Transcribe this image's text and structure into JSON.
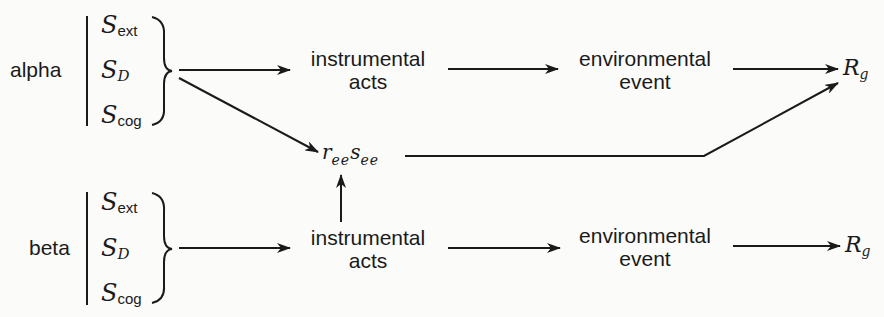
{
  "diagram": {
    "groups": [
      {
        "label": "alpha",
        "stimuli": [
          {
            "base": "S",
            "sub": "ext"
          },
          {
            "base": "S",
            "sub": "D"
          },
          {
            "base": "S",
            "sub": "cog"
          }
        ],
        "instrumental": {
          "line1": "instrumental",
          "line2": "acts"
        },
        "environmental": {
          "line1": "environmental",
          "line2": "event"
        },
        "response": {
          "base": "R",
          "sub": "g"
        }
      },
      {
        "label": "beta",
        "stimuli": [
          {
            "base": "S",
            "sub": "ext"
          },
          {
            "base": "S",
            "sub": "D"
          },
          {
            "base": "S",
            "sub": "cog"
          }
        ],
        "instrumental": {
          "line1": "instrumental",
          "line2": "acts"
        },
        "environmental": {
          "line1": "environmental",
          "line2": "event"
        },
        "response": {
          "base": "R",
          "sub": "g"
        }
      }
    ],
    "mediator": {
      "r": "r",
      "r_sub": "ee",
      "s": "s",
      "s_sub": "ee"
    },
    "colors": {
      "ink": "#1a1a1a",
      "background": "#fbfbfa"
    }
  }
}
